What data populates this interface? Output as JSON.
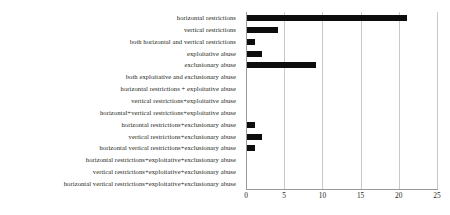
{
  "chart_data": {
    "type": "bar",
    "orientation": "horizontal",
    "title": "",
    "xlabel": "",
    "ylabel": "",
    "xlim": [
      0,
      25
    ],
    "xticks": [
      0,
      5,
      10,
      15,
      20,
      25
    ],
    "grid": true,
    "legend": null,
    "bar_color": "#0d0d0d",
    "grid_color": "#c9c9c9",
    "axis_color": "#9a9a9a",
    "categories": [
      "horizontal restrictions",
      "vertical restrictions",
      "both horizontal and vertical restrictions",
      "exploitative abuse",
      "exclusionary abuse",
      "both exploitative and exclusionary abuse",
      "horizontal restrictions + exploitative abuse",
      "vertical restrictions+exploitative abuse",
      "horizontal+vertical restrictions+exploitative abuse",
      "horizontal restrictions+exclusionary abuse",
      "vertical restrictions+exclusionary abuse",
      "horizontal vertical restrictions+exclusionary abuse",
      "horizontal restrictions+exploitative+exclusionary abuse",
      "vertical restrictions+exploitative+exclusionary abuse",
      "horizontal vertical restrictions+exploitative+exclusionary abuse"
    ],
    "values": [
      21,
      4,
      1,
      2,
      9,
      0,
      0,
      0,
      0,
      1,
      2,
      1,
      0,
      0,
      0
    ]
  }
}
